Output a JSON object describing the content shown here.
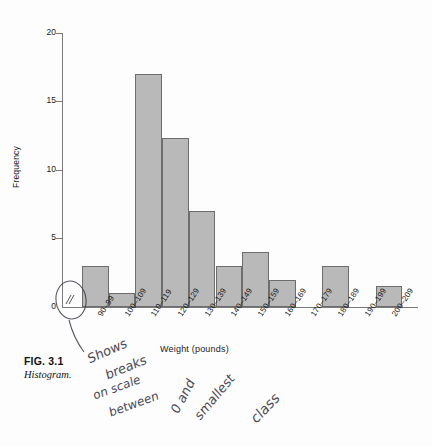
{
  "figure": {
    "number_label": "FIG. 3.1",
    "caption": "Histogram."
  },
  "chart_data": {
    "type": "bar",
    "title": "",
    "subtitle": "",
    "xlabel": "Weight (pounds)",
    "ylabel": "Frequency",
    "categories": [
      "90–99",
      "100–109",
      "110–119",
      "120–129",
      "130–139",
      "140–149",
      "150–159",
      "160–169",
      "170–179",
      "180–189",
      "190–199",
      "200–209"
    ],
    "values": [
      3,
      1,
      17,
      12.3,
      7,
      3,
      4,
      2,
      0,
      3,
      0,
      1.5
    ],
    "ylim": [
      0,
      20
    ],
    "yticks": [
      0,
      5,
      10,
      15,
      20
    ],
    "grid": false,
    "legend": false,
    "bar_fill_color": "#b9b9b9",
    "bar_edge_color": "#6d6d6d",
    "axis_color": "#7a7a7a",
    "axis_break": true,
    "axis_break_note": "break on vertical scale between 0 and smallest class"
  },
  "annotations": {
    "ink_color": "#3a3a48",
    "handwriting_full_text": "Shows breaks on scale between 0 and smallest class",
    "handwriting_words": [
      {
        "text": "Shows",
        "x": 86,
        "y": 352,
        "rot": -24,
        "size": 13
      },
      {
        "text": "breaks",
        "x": 104,
        "y": 368,
        "rot": -22,
        "size": 13
      },
      {
        "text": "on scale",
        "x": 92,
        "y": 389,
        "rot": -20,
        "size": 12
      },
      {
        "text": "between",
        "x": 108,
        "y": 406,
        "rot": -20,
        "size": 12
      },
      {
        "text": "0 and",
        "x": 168,
        "y": 408,
        "rot": -62,
        "size": 13
      },
      {
        "text": "smallest",
        "x": 192,
        "y": 412,
        "rot": -50,
        "size": 13
      },
      {
        "text": "class",
        "x": 248,
        "y": 414,
        "rot": -46,
        "size": 14
      }
    ],
    "circle_target": "axis-break-symbol",
    "leader_line": "from circled axis break down-left to handwritten note"
  }
}
